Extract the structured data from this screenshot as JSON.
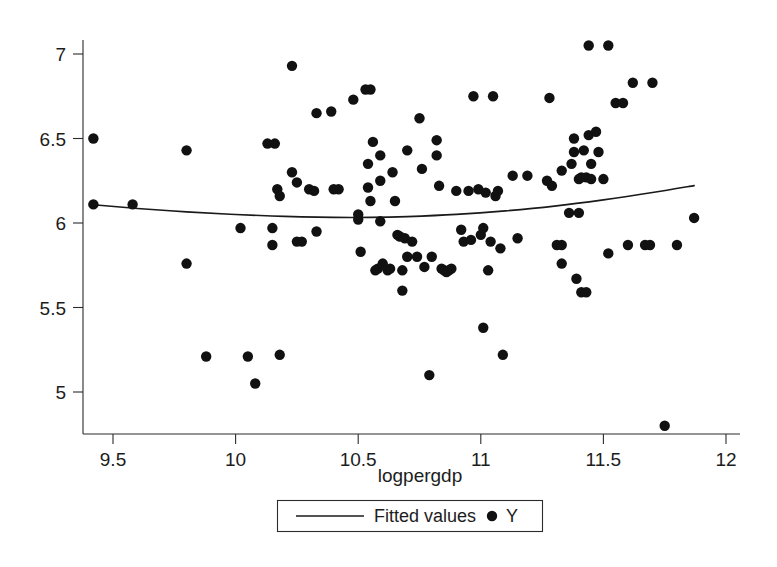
{
  "chart_data": {
    "type": "scatter",
    "title": "",
    "subtitle": "",
    "xlabel": "logpergdp",
    "ylabel": "",
    "xlim": [
      9.38,
      12.05
    ],
    "ylim": [
      4.75,
      7.12
    ],
    "xticks": [
      9.5,
      10,
      10.5,
      11,
      11.5,
      12
    ],
    "xticklabels": [
      "9.5",
      "10",
      "10.5",
      "11",
      "11.5",
      "12"
    ],
    "yticks": [
      5,
      5.5,
      6,
      6.5,
      7
    ],
    "yticklabels": [
      "5",
      "5.5",
      "6",
      "6.5",
      "7"
    ],
    "grid": false,
    "legend_position": "below-axis",
    "legend": [
      {
        "label": "Fitted values",
        "marker": "line"
      },
      {
        "label": "Y",
        "marker": "dot"
      }
    ],
    "series": [
      {
        "name": "Y",
        "type": "scatter",
        "marker": "filled-circle",
        "color": "#111111",
        "points": [
          [
            9.42,
            6.5
          ],
          [
            9.42,
            6.11
          ],
          [
            9.58,
            6.11
          ],
          [
            9.8,
            6.43
          ],
          [
            9.8,
            5.76
          ],
          [
            9.88,
            5.21
          ],
          [
            10.02,
            5.97
          ],
          [
            10.05,
            5.21
          ],
          [
            10.08,
            5.05
          ],
          [
            10.13,
            6.47
          ],
          [
            10.16,
            6.47
          ],
          [
            10.15,
            5.97
          ],
          [
            10.15,
            5.87
          ],
          [
            10.17,
            6.2
          ],
          [
            10.18,
            6.16
          ],
          [
            10.18,
            5.22
          ],
          [
            10.23,
            6.93
          ],
          [
            10.23,
            6.3
          ],
          [
            10.25,
            6.24
          ],
          [
            10.25,
            5.89
          ],
          [
            10.27,
            5.89
          ],
          [
            10.3,
            6.2
          ],
          [
            10.32,
            6.19
          ],
          [
            10.33,
            6.65
          ],
          [
            10.33,
            5.95
          ],
          [
            10.39,
            6.66
          ],
          [
            10.4,
            6.2
          ],
          [
            10.42,
            6.2
          ],
          [
            10.48,
            6.73
          ],
          [
            10.5,
            6.02
          ],
          [
            10.5,
            6.05
          ],
          [
            10.51,
            5.83
          ],
          [
            10.53,
            6.79
          ],
          [
            10.55,
            6.79
          ],
          [
            10.54,
            6.35
          ],
          [
            10.54,
            6.21
          ],
          [
            10.55,
            6.13
          ],
          [
            10.56,
            6.48
          ],
          [
            10.57,
            5.72
          ],
          [
            10.58,
            5.73
          ],
          [
            10.59,
            6.4
          ],
          [
            10.59,
            6.25
          ],
          [
            10.59,
            6.01
          ],
          [
            10.6,
            5.76
          ],
          [
            10.62,
            5.72
          ],
          [
            10.63,
            5.73
          ],
          [
            10.64,
            6.3
          ],
          [
            10.65,
            6.13
          ],
          [
            10.66,
            5.93
          ],
          [
            10.67,
            5.92
          ],
          [
            10.68,
            5.6
          ],
          [
            10.68,
            5.72
          ],
          [
            10.69,
            5.91
          ],
          [
            10.7,
            6.43
          ],
          [
            10.7,
            5.8
          ],
          [
            10.72,
            5.89
          ],
          [
            10.74,
            5.8
          ],
          [
            10.75,
            6.62
          ],
          [
            10.76,
            6.32
          ],
          [
            10.77,
            5.74
          ],
          [
            10.79,
            5.1
          ],
          [
            10.8,
            5.8
          ],
          [
            10.82,
            6.49
          ],
          [
            10.82,
            6.4
          ],
          [
            10.83,
            6.22
          ],
          [
            10.84,
            5.73
          ],
          [
            10.85,
            5.72
          ],
          [
            10.86,
            5.71
          ],
          [
            10.87,
            5.72
          ],
          [
            10.88,
            5.73
          ],
          [
            10.9,
            6.19
          ],
          [
            10.92,
            5.96
          ],
          [
            10.93,
            5.89
          ],
          [
            10.95,
            6.19
          ],
          [
            10.96,
            5.9
          ],
          [
            10.97,
            6.75
          ],
          [
            10.99,
            6.2
          ],
          [
            11.0,
            5.93
          ],
          [
            11.01,
            5.97
          ],
          [
            11.01,
            5.38
          ],
          [
            11.02,
            6.18
          ],
          [
            11.03,
            5.72
          ],
          [
            11.04,
            5.89
          ],
          [
            11.05,
            6.75
          ],
          [
            11.06,
            6.16
          ],
          [
            11.07,
            6.19
          ],
          [
            11.08,
            5.85
          ],
          [
            11.09,
            5.22
          ],
          [
            11.13,
            6.28
          ],
          [
            11.15,
            5.91
          ],
          [
            11.19,
            6.28
          ],
          [
            11.27,
            6.25
          ],
          [
            11.28,
            6.74
          ],
          [
            11.29,
            6.22
          ],
          [
            11.31,
            5.87
          ],
          [
            11.33,
            5.87
          ],
          [
            11.33,
            6.31
          ],
          [
            11.33,
            5.76
          ],
          [
            11.36,
            6.06
          ],
          [
            11.37,
            6.35
          ],
          [
            11.38,
            6.5
          ],
          [
            11.38,
            6.42
          ],
          [
            11.39,
            5.67
          ],
          [
            11.4,
            6.06
          ],
          [
            11.4,
            6.26
          ],
          [
            11.41,
            5.59
          ],
          [
            11.41,
            6.27
          ],
          [
            11.42,
            6.43
          ],
          [
            11.43,
            5.59
          ],
          [
            11.43,
            6.27
          ],
          [
            11.44,
            7.05
          ],
          [
            11.44,
            6.52
          ],
          [
            11.45,
            6.26
          ],
          [
            11.45,
            6.35
          ],
          [
            11.47,
            6.54
          ],
          [
            11.48,
            6.42
          ],
          [
            11.5,
            6.26
          ],
          [
            11.52,
            7.05
          ],
          [
            11.52,
            5.82
          ],
          [
            11.55,
            6.71
          ],
          [
            11.58,
            6.71
          ],
          [
            11.6,
            5.87
          ],
          [
            11.62,
            6.83
          ],
          [
            11.67,
            5.87
          ],
          [
            11.69,
            5.87
          ],
          [
            11.7,
            6.83
          ],
          [
            11.75,
            4.8
          ],
          [
            11.8,
            5.87
          ],
          [
            11.87,
            6.03
          ]
        ]
      },
      {
        "name": "Fitted values",
        "type": "line",
        "color": "#1a1a1a",
        "points": [
          [
            9.42,
            6.108
          ],
          [
            9.6,
            6.086
          ],
          [
            9.8,
            6.066
          ],
          [
            10.0,
            6.05
          ],
          [
            10.2,
            6.039
          ],
          [
            10.4,
            6.033
          ],
          [
            10.55,
            6.033
          ],
          [
            10.7,
            6.038
          ],
          [
            10.9,
            6.051
          ],
          [
            11.1,
            6.072
          ],
          [
            11.3,
            6.1
          ],
          [
            11.5,
            6.137
          ],
          [
            11.7,
            6.18
          ],
          [
            11.87,
            6.221
          ]
        ]
      }
    ]
  },
  "figure": {
    "plot_area": {
      "left": 83,
      "right": 737,
      "top": 40,
      "bottom": 434
    },
    "marker_radius": 5.2
  }
}
